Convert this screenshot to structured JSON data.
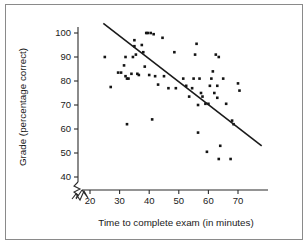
{
  "chart_data": {
    "type": "scatter",
    "title": "",
    "xlabel": "Time to complete exam (in minutes)",
    "ylabel": "Grade (percentage correct)",
    "xlim": [
      17,
      78
    ],
    "ylim": [
      38,
      104
    ],
    "xticks": [
      20,
      30,
      40,
      50,
      60,
      70
    ],
    "yticks": [
      40,
      50,
      60,
      70,
      80,
      90,
      100
    ],
    "xtick_labels": [
      "20",
      "30",
      "40",
      "50",
      "60",
      "70"
    ],
    "ytick_labels": [
      "40",
      "50",
      "60",
      "70",
      "80",
      "90",
      "100"
    ],
    "grid": false,
    "legend": null,
    "axis_break_x": true,
    "axis_break_y": true,
    "marker": "filled-square-dot",
    "marker_color": "#141414",
    "trendline": {
      "visible": true,
      "x": [
        24.5,
        78.0
      ],
      "y": [
        104.0,
        53.0
      ],
      "color": "#1a1a1a"
    },
    "points": [
      [
        25.0,
        90.0
      ],
      [
        27.0,
        77.5
      ],
      [
        29.5,
        83.5
      ],
      [
        30.5,
        83.5
      ],
      [
        31.5,
        86.5
      ],
      [
        32.0,
        90.0
      ],
      [
        32.0,
        82.0
      ],
      [
        32.5,
        81.0
      ],
      [
        32.5,
        62.0
      ],
      [
        33.0,
        81.0
      ],
      [
        34.0,
        83.0
      ],
      [
        34.5,
        90.0
      ],
      [
        35.0,
        94.5
      ],
      [
        35.0,
        97.0
      ],
      [
        35.5,
        91.0
      ],
      [
        36.0,
        83.0
      ],
      [
        36.5,
        82.5
      ],
      [
        37.5,
        95.0
      ],
      [
        38.0,
        92.0
      ],
      [
        38.5,
        86.0
      ],
      [
        39.0,
        100.0
      ],
      [
        39.5,
        100.0
      ],
      [
        40.0,
        82.5
      ],
      [
        40.5,
        100.0
      ],
      [
        41.0,
        64.0
      ],
      [
        41.5,
        99.5
      ],
      [
        42.0,
        82.0
      ],
      [
        43.0,
        78.5
      ],
      [
        44.5,
        98.0
      ],
      [
        45.0,
        82.0
      ],
      [
        46.5,
        77.0
      ],
      [
        48.5,
        92.0
      ],
      [
        49.0,
        77.0
      ],
      [
        51.5,
        81.0
      ],
      [
        52.5,
        78.0
      ],
      [
        53.5,
        73.5
      ],
      [
        54.5,
        77.0
      ],
      [
        55.0,
        81.0
      ],
      [
        55.5,
        91.0
      ],
      [
        56.0,
        95.5
      ],
      [
        56.5,
        70.0
      ],
      [
        56.5,
        58.5
      ],
      [
        57.0,
        81.0
      ],
      [
        57.5,
        75.0
      ],
      [
        58.0,
        73.5
      ],
      [
        59.0,
        70.5
      ],
      [
        59.5,
        50.5
      ],
      [
        60.0,
        70.5
      ],
      [
        60.5,
        78.0
      ],
      [
        61.0,
        81.0
      ],
      [
        61.5,
        84.0
      ],
      [
        62.0,
        75.0
      ],
      [
        62.5,
        91.0
      ],
      [
        63.0,
        78.0
      ],
      [
        63.0,
        73.0
      ],
      [
        63.5,
        90.0
      ],
      [
        63.5,
        47.5
      ],
      [
        64.0,
        53.0
      ],
      [
        65.0,
        81.0
      ],
      [
        66.0,
        70.5
      ],
      [
        67.5,
        47.5
      ],
      [
        68.0,
        63.5
      ],
      [
        68.5,
        62.0
      ],
      [
        70.0,
        79.0
      ],
      [
        70.5,
        76.0
      ]
    ]
  },
  "axis": {
    "x_title": "Time to complete exam (in minutes)",
    "y_title": "Grade (percentage correct)"
  }
}
